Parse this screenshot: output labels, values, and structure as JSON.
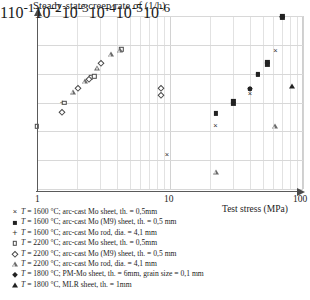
{
  "chart_data": {
    "type": "scatter",
    "title": "Steady-state creep rate of (1/h)",
    "xlabel": "Test stress (MPa)",
    "ylabel": "Steady-state creep rate of (1/h)",
    "xscale": "log",
    "yscale": "log",
    "xlim": [
      1,
      100
    ],
    "ylim": [
      1e-06,
      1
    ],
    "xticks": [
      "1",
      "10",
      "100"
    ],
    "yticks": [
      "1",
      "10-1",
      "10-2",
      "10-3",
      "10-4",
      "10-5",
      "10-6"
    ],
    "grid": true,
    "legend_position": "below-plot",
    "series": [
      {
        "name": "T = 1600 °C; arc-cast Mo sheet, th. = 0,5mm",
        "marker": "cross",
        "temperature": "1600",
        "points": [
          [
            9.5,
            1.5e-05
          ],
          [
            22,
            0.00015
          ],
          [
            40,
            0.0019
          ],
          [
            62,
            0.06
          ]
        ]
      },
      {
        "name": "T = 1600 °C; arc-cast Mo (M9) sheet, th. = 0,5mm",
        "marker": "filled-square",
        "temperature": "1600",
        "points": [
          [
            22,
            0.00042
          ],
          [
            30,
            0.0009
          ],
          [
            30,
            0.0011
          ],
          [
            40,
            0.003
          ],
          [
            46,
            0.01
          ],
          [
            46,
            0.0092
          ],
          [
            54,
            0.021
          ],
          [
            54,
            0.026
          ],
          [
            70,
            1.0
          ],
          [
            70,
            0.85
          ]
        ]
      },
      {
        "name": "T = 1600 °C; arc-cast Mo rod, dia. = 4,1mm",
        "marker": "plus",
        "temperature": "1600",
        "points": [
          [
            1.55,
            0.00095
          ]
        ]
      },
      {
        "name": "T = 2200 °C; arc-cast Mo sheet, th. = 0,5mm",
        "marker": "open-square",
        "temperature": "2200",
        "points": [
          [
            1.0,
            0.00015
          ],
          [
            1.6,
            0.001
          ],
          [
            2.55,
            0.0075
          ],
          [
            2.7,
            0.0082
          ],
          [
            4.3,
            0.07
          ]
        ]
      },
      {
        "name": "T = 2200 °C; arc-cast Mo (M9) sheet, th. = 0,5mm",
        "marker": "open-diamond",
        "temperature": "2200",
        "points": [
          [
            1.55,
            0.00046
          ],
          [
            2.05,
            0.0032
          ],
          [
            2.45,
            0.0068
          ],
          [
            3.05,
            0.024
          ],
          [
            8.5,
            0.0018
          ],
          [
            8.5,
            0.0031
          ]
        ]
      },
      {
        "name": "T = 2200 °C; arc-cast Mo rod, dia. = 4,1mm",
        "marker": "open-triangle",
        "temperature": "2200",
        "points": [
          [
            1.85,
            0.0024
          ],
          [
            2.3,
            0.0056
          ],
          [
            2.85,
            0.016
          ],
          [
            3.6,
            0.048
          ],
          [
            4.2,
            0.066
          ],
          [
            22,
            4e-06
          ],
          [
            62,
            0.00015
          ]
        ]
      },
      {
        "name": "T = 1800 °C; PM-Mo sheet, th. = 6mm, grain size = 0,1 mm",
        "marker": "filled-diamond",
        "temperature": "1800",
        "points": [
          [
            40,
            0.0029
          ],
          [
            70,
            0.95
          ]
        ]
      },
      {
        "name": "T = 1800 °C; MLR sheet, th. = 1mm",
        "marker": "filled-triangle",
        "temperature": "1800",
        "points": [
          [
            83,
            0.0036
          ]
        ]
      }
    ]
  },
  "legend": {
    "entries": [
      {
        "marker": "cross",
        "prefix": "T",
        "text": " = 1600 °C; arc-cast Mo sheet, th. = 0,5mm"
      },
      {
        "marker": "filled-square",
        "prefix": "T",
        "text": " = 1600 °C; arc-cast Mo (M9) sheet, th. = 0,5 mm"
      },
      {
        "marker": "plus",
        "prefix": "T",
        "text": " = 1600 °C; arc-cast Mo rod, dia. = 4,1 mm"
      },
      {
        "marker": "open-square",
        "prefix": "T",
        "text": " = 2200 °C; arc-cast Mo sheet, th. = 0,5mm"
      },
      {
        "marker": "open-diamond",
        "prefix": "T",
        "text": " = 2200 °C; arc-cast Mo (M9) sheet, th. = 0,5 mm"
      },
      {
        "marker": "open-triangle",
        "prefix": "T",
        "text": " = 2200 °C; arc-cast Mo rod, dia. = 4,1 mm"
      },
      {
        "marker": "filled-diamond",
        "prefix": "T",
        "text": " = 1800 °C; PM-Mo sheet, th. = 6mm, grain size = 0,1 mm"
      },
      {
        "marker": "filled-triangle",
        "prefix": "T",
        "text": " = 1800 °C, MLR sheet, th. = 1mm"
      }
    ]
  },
  "axes": {
    "y_labels": [
      {
        "mantissa": "1",
        "exp": ""
      },
      {
        "mantissa": "10",
        "exp": "-1"
      },
      {
        "mantissa": "10",
        "exp": "-2"
      },
      {
        "mantissa": "10",
        "exp": "-3"
      },
      {
        "mantissa": "10",
        "exp": "-4"
      },
      {
        "mantissa": "10",
        "exp": "-5"
      },
      {
        "mantissa": "10",
        "exp": "-6"
      }
    ],
    "x_labels": [
      "1",
      "10",
      "100"
    ],
    "x_axis_title": "Test stress (MPa)"
  }
}
